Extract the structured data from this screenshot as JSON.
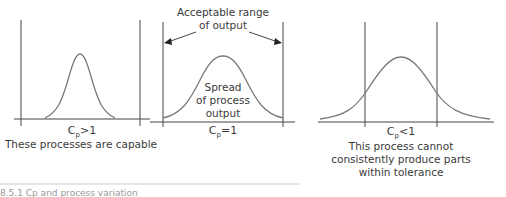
{
  "diagram": {
    "type": "process-capability-comparison",
    "panels": [
      {
        "id": "capable",
        "cp_symbol": "C",
        "cp_subscript": "p",
        "cp_relation": ">1",
        "description": "These processes are capable"
      },
      {
        "id": "exactly-capable",
        "cp_symbol": "C",
        "cp_subscript": "p",
        "cp_relation": "=1",
        "range_label_line1": "Acceptable range",
        "range_label_line2": "of output",
        "spread_label_line1": "Spread",
        "spread_label_line2": "of process",
        "spread_label_line3": "output"
      },
      {
        "id": "not-capable",
        "cp_symbol": "C",
        "cp_subscript": "p",
        "cp_relation": "<1",
        "description_line1": "This process cannot",
        "description_line2": "consistently produce parts",
        "description_line3": "within tolerance"
      }
    ],
    "caption": "8.5.1  Cp and process variation"
  },
  "colors": {
    "curve": "#7a7a7a",
    "lines": "#444444",
    "text": "#3a3a3a"
  }
}
